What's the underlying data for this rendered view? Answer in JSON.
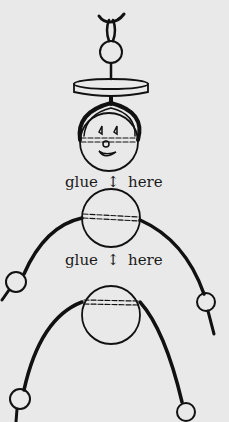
{
  "diagram": {
    "labels": [
      {
        "word1": "glue",
        "arrow": "↕",
        "word2": "here"
      },
      {
        "word1": "glue",
        "arrow": "↕",
        "word2": "here"
      }
    ],
    "colors": {
      "background": "#e9e9e9",
      "ink": "#111111"
    },
    "parts": [
      "hanging-string",
      "top-bead",
      "disc-hat",
      "head-with-face",
      "upper-body-sphere",
      "left-arm",
      "right-arm",
      "lower-body-sphere",
      "left-leg",
      "right-leg"
    ]
  }
}
